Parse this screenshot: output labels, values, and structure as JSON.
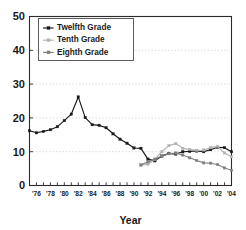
{
  "chart_data": {
    "type": "line",
    "title": "",
    "xlabel": "Year",
    "ylabel": "",
    "xlim": [
      1975,
      2004
    ],
    "ylim": [
      0,
      50
    ],
    "grid": true,
    "legend_position": "top-left",
    "y_ticks": [
      "0",
      "10",
      "20",
      "30",
      "40",
      "50"
    ],
    "y_tick_values": [
      0,
      10,
      20,
      30,
      40,
      50
    ],
    "x_ticks": [
      "'76",
      "'78",
      "'80",
      "'82",
      "'84",
      "'86",
      "'88",
      "'90",
      "'92",
      "'94",
      "'96",
      "'98",
      "'00",
      "'02",
      "'04"
    ],
    "x_tick_values": [
      1976,
      1978,
      1980,
      1982,
      1984,
      1986,
      1988,
      1990,
      1992,
      1994,
      1996,
      1998,
      2000,
      2002,
      2004
    ],
    "x_minor_ticks": [
      1975,
      1976,
      1977,
      1978,
      1979,
      1980,
      1981,
      1982,
      1983,
      1984,
      1985,
      1986,
      1987,
      1988,
      1989,
      1990,
      1991,
      1992,
      1993,
      1994,
      1995,
      1996,
      1997,
      1998,
      1999,
      2000,
      2001,
      2002,
      2003,
      2004
    ],
    "series": [
      {
        "name": "Twelfth Grade",
        "color": "#1a1a1a",
        "marker": "square",
        "x": [
          1975,
          1976,
          1977,
          1978,
          1979,
          1980,
          1981,
          1982,
          1983,
          1984,
          1985,
          1986,
          1987,
          1988,
          1989,
          1990,
          1991,
          1992,
          1993,
          1994,
          1995,
          1996,
          1997,
          1998,
          1999,
          2000,
          2001,
          2002,
          2003,
          2004
        ],
        "values": [
          16.2,
          15.6,
          16.0,
          16.5,
          17.4,
          19.2,
          21.1,
          26.2,
          20.1,
          18.0,
          17.8,
          17.1,
          15.3,
          13.7,
          12.5,
          11.1,
          11.0,
          7.8,
          7.3,
          8.7,
          9.5,
          9.3,
          10.0,
          10.1,
          10.2,
          10.0,
          10.6,
          11.3,
          11.2,
          10.0
        ]
      },
      {
        "name": "Tenth Grade",
        "color": "#b2b2b2",
        "marker": "square",
        "x": [
          1991,
          1992,
          1993,
          1994,
          1995,
          1996,
          1997,
          1998,
          1999,
          2000,
          2001,
          2002,
          2003,
          2004
        ],
        "values": [
          6.0,
          6.3,
          7.7,
          10.0,
          11.8,
          12.4,
          11.0,
          10.7,
          10.4,
          10.5,
          11.2,
          11.6,
          9.6,
          8.5
        ]
      },
      {
        "name": "Eighth Grade",
        "color": "#808080",
        "marker": "square",
        "x": [
          1991,
          1992,
          1993,
          1994,
          1995,
          1996,
          1997,
          1998,
          1999,
          2000,
          2001,
          2002,
          2003,
          2004
        ],
        "values": [
          6.1,
          7.0,
          7.8,
          8.7,
          9.4,
          9.6,
          9.0,
          8.2,
          7.4,
          6.7,
          6.6,
          6.2,
          5.2,
          4.5
        ]
      }
    ]
  },
  "axis": {
    "x_title": "Year"
  },
  "legend": {
    "entries": [
      {
        "label": "Twelfth Grade"
      },
      {
        "label": "Tenth Grade"
      },
      {
        "label": "Eighth Grade"
      }
    ]
  }
}
